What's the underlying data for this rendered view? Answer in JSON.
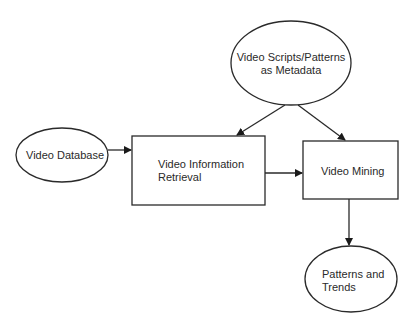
{
  "diagram": {
    "nodes": [
      {
        "id": "video-database",
        "shape": "ellipse",
        "label": "Video Database"
      },
      {
        "id": "video-information-retrieval",
        "shape": "rectangle",
        "label_lines": [
          "Video Information",
          "Retrieval"
        ]
      },
      {
        "id": "video-scripts-metadata",
        "shape": "ellipse",
        "label_lines": [
          "Video Scripts/Patterns",
          "as Metadata"
        ]
      },
      {
        "id": "video-mining",
        "shape": "rectangle",
        "label": "Video Mining"
      },
      {
        "id": "patterns-and-trends",
        "shape": "ellipse",
        "label_lines": [
          "Patterns and",
          "Trends"
        ]
      }
    ],
    "edges": [
      {
        "from": "video-database",
        "to": "video-information-retrieval"
      },
      {
        "from": "video-scripts-metadata",
        "to": "video-information-retrieval"
      },
      {
        "from": "video-scripts-metadata",
        "to": "video-mining"
      },
      {
        "from": "video-information-retrieval",
        "to": "video-mining"
      },
      {
        "from": "video-mining",
        "to": "patterns-and-trends"
      }
    ],
    "colors": {
      "stroke": "#2a2a2a",
      "text": "#2a2a2a",
      "background": "#ffffff"
    }
  }
}
